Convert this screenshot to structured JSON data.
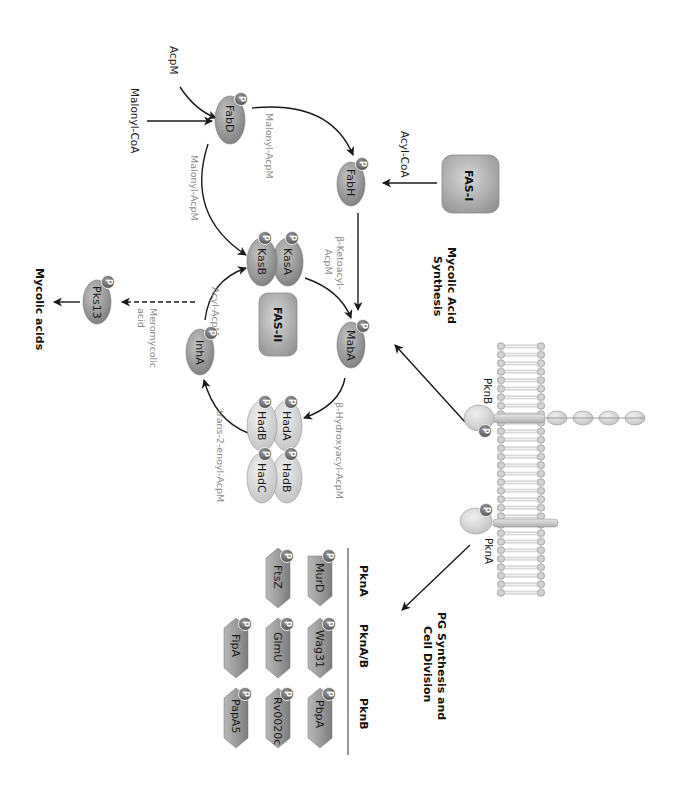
{
  "orientation": "rotated-90-clockwise",
  "colors": {
    "enzyme_dark": "#8c8c8c",
    "enzyme_light": "#d6d6d6",
    "fas_box": "#a8a8a8",
    "phospho_badge": "#6e6e6e",
    "substrate_text": "#8a8a8a",
    "arrow": "#1a1a1a",
    "membrane": "#c8c8c8"
  },
  "inputs": {
    "acpm": "AcpM",
    "malonyl_coa": "Malonyl-CoA",
    "acyl_coa": "Acyl-CoA"
  },
  "complexes": {
    "fas1": "FAS-I",
    "fas2": "FAS-II"
  },
  "enzymes": {
    "fabd": "FabD",
    "fabh": "FabH",
    "kasa": "KasA",
    "kasb": "KasB",
    "maba": "MabA",
    "hada": "HadA",
    "hadb1": "HadB",
    "hadb2": "HadB",
    "hadc": "HadC",
    "inha": "InhA",
    "pks13": "Pks13"
  },
  "phospho_label": "P",
  "intermediates": {
    "malonyl_acpm_top": "Malonyl-AcpM",
    "malonyl_acpm_left": "Malonyl-AcpM",
    "ketoacyl_1": "β-Ketoacyl-",
    "ketoacyl_2": "AcpM",
    "hydroxyacyl": "β-Hydroxyacyl-AcpM",
    "enoyl": "trans-2-enoyl-AcpM",
    "acyl_acpm": "Acyl-AcpM",
    "meromycolic_1": "Meromycolic",
    "meromycolic_2": "acid"
  },
  "outputs": {
    "mycolic_acids": "Mycolic acids"
  },
  "pathways": {
    "mycolic_1": "Mycolic Acid",
    "mycolic_2": "Synthesis",
    "pg_1": "PG Synthesis and",
    "pg_2": "Cell Division"
  },
  "kinases": {
    "pknb": "PknB",
    "pkna": "PknA"
  },
  "substrate_table": {
    "columns": [
      "PknA",
      "PknA/B",
      "PknB"
    ],
    "rows": [
      [
        "MurD",
        "Wag31",
        "PbpA"
      ],
      [
        "FtsZ",
        "GlmU",
        "Rv0020c"
      ],
      [
        "",
        "FipA",
        "PapA5"
      ]
    ]
  }
}
